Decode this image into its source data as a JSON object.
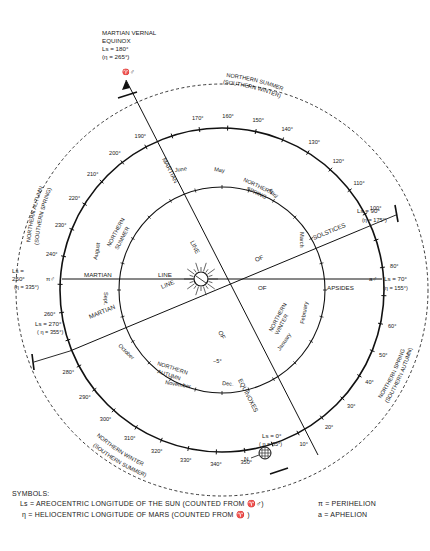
{
  "header": {
    "title_lines": [
      "MARTIAN VERNAL",
      "EQUINOX",
      "Ls = 180°",
      "(η = 265°)"
    ],
    "equinox_symbol": "♈♂"
  },
  "orbit": {
    "degree_labels": [
      "10°",
      "20°",
      "30°",
      "40°",
      "50°",
      "60°",
      "80°",
      "100°",
      "110°",
      "120°",
      "130°",
      "140°",
      "150°",
      "160°",
      "170°",
      "190°",
      "200°",
      "210°",
      "220°",
      "230°",
      "240°",
      "260°",
      "280°",
      "290°",
      "300°",
      "310°",
      "320°",
      "330°",
      "340°",
      "350°"
    ],
    "degree_values": [
      10,
      20,
      30,
      40,
      50,
      60,
      80,
      100,
      110,
      120,
      130,
      140,
      150,
      160,
      170,
      190,
      200,
      210,
      220,
      230,
      240,
      260,
      280,
      290,
      300,
      310,
      320,
      330,
      340,
      350
    ],
    "key_points": {
      "ls0": {
        "label": "Ls = 0°",
        "eta": "( η = 85°)"
      },
      "ls90": {
        "label": "Ls = 90°",
        "eta": "(η = 175°)"
      },
      "ls270": {
        "label": "Ls = 270°",
        "eta": "( η = 355°)"
      },
      "ls250": {
        "label1": "Ls =",
        "label2": "250°",
        "symbol": "π♂",
        "eta": "(η = 335°)"
      },
      "ls70": {
        "symbol": "a♂",
        "label": "Ls = 70°",
        "eta": "(η = 155°)"
      }
    }
  },
  "seasons_outer": {
    "top_right": [
      "NORTHERN SUMMER",
      "(SOUTHERN WINTER)"
    ],
    "left": [
      "NORTHERN AUTUMN",
      "(SOUTHERN SPRING)"
    ],
    "right": [
      "NORTHERN SPRING",
      "(SOUTHERN AUTUMN)"
    ],
    "bottom_left": [
      "NORTHERN WINTER",
      "(SOUTHERN SUMMER)"
    ]
  },
  "seasons_inner": {
    "spring": [
      "NORTHERN",
      "SPRING"
    ],
    "summer": [
      "NORTHERN",
      "SUMMER"
    ],
    "autumn": [
      "NORTHERN",
      "AUTUMN"
    ],
    "winter": [
      "NORTHERN",
      "WINTER"
    ]
  },
  "months": [
    "March",
    "April",
    "May",
    "June",
    "August",
    "Sept.",
    "October",
    "November",
    "Dec.",
    "January",
    "February"
  ],
  "lines": {
    "equinoxes": [
      "MARTIAN",
      "LINE",
      "OF",
      "EQUINOXES"
    ],
    "solstices": [
      "MARTIAN",
      "LINE",
      "OF",
      "SOLSTICES"
    ],
    "apsides": [
      "MARTIAN",
      "LINE",
      "OF",
      "APSIDES"
    ]
  },
  "misc": {
    "minus5": "−5°",
    "north_marker": "N"
  },
  "legend": {
    "heading": "SYMBOLS:",
    "ls_symbol": "Ls",
    "ls_text": "= AREOCENTRIC LONGITUDE OF THE SUN (COUNTED FROM ♈♂)",
    "eta_symbol": "η",
    "eta_text": "= HELIOCENTRIC LONGITUDE OF MARS    (COUNTED FROM ♈ )",
    "pi_text": "π  =  PERIHELION",
    "a_text": "a  =  APHELION"
  }
}
